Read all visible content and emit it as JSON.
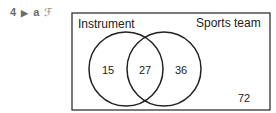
{
  "question": {
    "number": "4",
    "arrow_icon": "right-triangle-icon",
    "part": "a",
    "calculator_icon": "no-calculator-icon"
  },
  "venn": {
    "sets": [
      {
        "label": "Instrument",
        "only_value": "15"
      },
      {
        "label": "Sports team",
        "only_value": "36"
      }
    ],
    "intersection": "27",
    "outside": "72"
  }
}
